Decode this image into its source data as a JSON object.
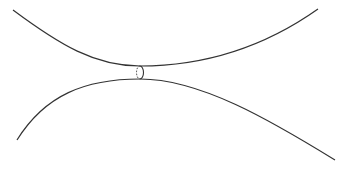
{
  "diagram": {
    "width": 350,
    "height": 169,
    "background": "#ffffff",
    "stroke_color": "#333333",
    "upper_curve": {
      "label": "upper-boundary-curve",
      "path": "M13,10 C60,45 95,66 140,66 C200,66 260,50 318,9"
    },
    "lower_curve": {
      "label": "lower-boundary-curve",
      "path": "M17,140 C45,95 85,79 140,79 C200,79 270,120 335,160"
    },
    "throat_ellipse": {
      "label": "throat-circle",
      "cx": 140,
      "cy": 72.5,
      "rx": 3.5,
      "ry": 6.5
    }
  }
}
